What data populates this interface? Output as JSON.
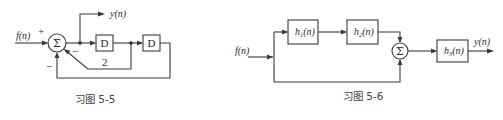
{
  "figures": [
    {
      "id": "fig-5-5",
      "caption": "习图 5-5",
      "input_label": "f(n)",
      "output_label": "y(n)",
      "summer_symbol": "Σ",
      "summer_signs": {
        "input": "+",
        "feedback_2": "−",
        "feedback_outer": "−"
      },
      "blocks": [
        {
          "name": "delay-1",
          "label": "D"
        },
        {
          "name": "delay-2",
          "label": "D"
        }
      ],
      "feedback_gain_label": "2"
    },
    {
      "id": "fig-5-6",
      "caption": "习图 5-6",
      "input_label": "f(n)",
      "output_label": "y(n)",
      "summer_symbol": "Σ",
      "blocks": [
        {
          "name": "h1",
          "base": "h",
          "sub": "1",
          "arg": "(n)"
        },
        {
          "name": "h2",
          "base": "h",
          "sub": "2",
          "arg": "(n)"
        },
        {
          "name": "h3",
          "base": "h",
          "sub": "3",
          "arg": "(n)"
        }
      ]
    }
  ],
  "colors": {
    "line": "#3a3a3a",
    "text": "#2a2a2a",
    "caption": "#444444",
    "background": "#ffffff"
  }
}
